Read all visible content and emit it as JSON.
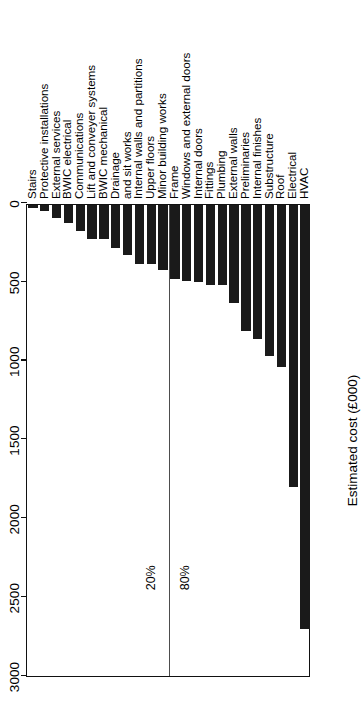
{
  "chart_data": {
    "type": "bar",
    "title": "",
    "subtitle": "",
    "orientation": "vertical-rotated",
    "xlabel": "",
    "ylabel": "Estimated cost (£000)",
    "ylim": [
      0,
      3000
    ],
    "yticks": [
      0,
      500,
      1000,
      1500,
      2000,
      2500,
      3000
    ],
    "ytick_labels": [
      "0",
      "500",
      "1000",
      "1500",
      "2000",
      "2500",
      "3000"
    ],
    "grid": false,
    "legend": null,
    "bar_color": "#1a1a1a",
    "categories": [
      "Stairs",
      "Protective installations",
      "External services",
      "BWIC electrical",
      "Communications",
      "Lift and conveyer systems",
      "BWIC mechanical",
      "Drainage",
      "and sit works",
      "Internal walls and partitions",
      "Upper floors",
      "Minor building works",
      "Frame",
      "Windows and external doors",
      "Internal doors",
      "Fittings",
      "Plumbing",
      "External walls",
      "Preliminaries",
      "Internal finishes",
      "Substructure",
      "Roof",
      "Electrical",
      "HVAC"
    ],
    "values": [
      20,
      40,
      80,
      115,
      165,
      215,
      215,
      275,
      320,
      375,
      375,
      415,
      470,
      485,
      490,
      510,
      510,
      620,
      800,
      850,
      960,
      1025,
      1790,
      2690
    ],
    "annotations": [
      {
        "text": "20%",
        "side": "left-of-split"
      },
      {
        "text": "80%",
        "side": "right-of-split"
      }
    ],
    "split_after_category": "Minor building works"
  },
  "figure": {
    "axis_title": "Estimated cost (£000)",
    "split_labels": {
      "lower": "20%",
      "upper": "80%"
    }
  }
}
